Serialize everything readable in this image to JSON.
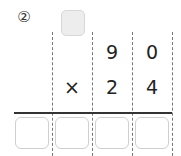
{
  "problem": {
    "number_label": "②",
    "multiplicand": [
      "9",
      "0"
    ],
    "operator": "×",
    "multiplier": [
      "2",
      "4"
    ],
    "carry_box_count": 1,
    "answer_box_count": 4
  }
}
